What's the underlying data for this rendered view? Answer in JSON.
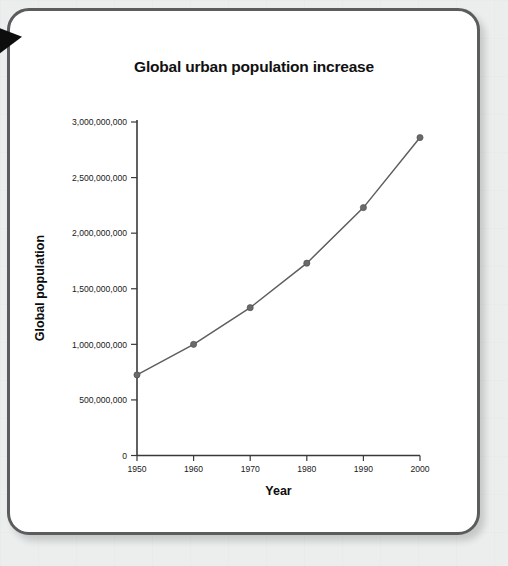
{
  "card": {
    "border_color": "#5a5c5e",
    "background": "#ffffff",
    "page_background": "#eceded"
  },
  "corner_marker": {
    "name": "page-corner-triangle",
    "color": "#0d0d0d"
  },
  "chart_data": {
    "type": "line",
    "title": "Global urban population increase",
    "xlabel": "Year",
    "ylabel": "Global population",
    "categories": [
      "1950",
      "1960",
      "1970",
      "1980",
      "1990",
      "2000"
    ],
    "x": [
      1950,
      1960,
      1970,
      1980,
      1990,
      2000
    ],
    "values": [
      725000000,
      1000000000,
      1330000000,
      1730000000,
      2230000000,
      2860000000
    ],
    "xlim": [
      1950,
      2000
    ],
    "ylim": [
      0,
      3000000000
    ],
    "ytick_labels": [
      "0",
      "500,000,000",
      "1,000,000,000",
      "1,500,000,000",
      "2,000,000,000",
      "2,500,000,000",
      "3,000,000,000"
    ],
    "ytick_values": [
      0,
      500000000,
      1000000000,
      1500000000,
      2000000000,
      2500000000,
      3000000000
    ],
    "xtick_labels": [
      "1950",
      "1960",
      "1970",
      "1980",
      "1990",
      "2000"
    ],
    "grid": false,
    "legend": null,
    "marker": "circle",
    "line_color": "#5e5e5e",
    "marker_color": "#6a6a6a"
  }
}
